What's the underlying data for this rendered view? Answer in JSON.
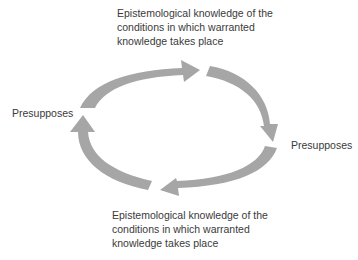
{
  "diagram": {
    "type": "cycle",
    "arrow_color": "#a6a6a6",
    "text_color": "#3a3a3a",
    "top_text": {
      "lines": [
        "Epistemological knowledge of the",
        "conditions in which warranted",
        "knowledge takes place"
      ]
    },
    "bottom_text": {
      "lines": [
        "Epistemological knowledge of the",
        "conditions in which warranted",
        "knowledge takes place"
      ]
    },
    "left_label": "Presupposes",
    "right_label": "Presupposes",
    "arrows": [
      {
        "name": "top-arc-arrow",
        "direction": "clockwise",
        "from": "left",
        "to": "top-right"
      },
      {
        "name": "right-arc-arrow",
        "direction": "clockwise",
        "from": "top-right",
        "to": "right"
      },
      {
        "name": "bottom-arc-arrow",
        "direction": "clockwise",
        "from": "right",
        "to": "bottom"
      },
      {
        "name": "left-arc-arrow",
        "direction": "clockwise",
        "from": "bottom",
        "to": "left"
      }
    ]
  }
}
